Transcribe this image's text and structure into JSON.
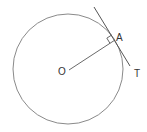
{
  "diagram": {
    "circle": {
      "cx": 68,
      "cy": 69,
      "r": 55,
      "stroke": "#8a8a8a"
    },
    "center": {
      "label": "O",
      "x": 69,
      "y": 70,
      "label_x": 58,
      "label_y": 75
    },
    "tangent_point": {
      "label": "A",
      "x": 115,
      "y": 40,
      "label_x": 116,
      "label_y": 41
    },
    "tangent_line": {
      "x1": 94,
      "y1": 7,
      "x2": 130,
      "y2": 66,
      "end_label": "T",
      "label_x": 134,
      "label_y": 77,
      "stroke": "#555555"
    },
    "radius_line": {
      "stroke": "#6a6a6a"
    },
    "right_angle_marker": {
      "size": 6
    }
  }
}
